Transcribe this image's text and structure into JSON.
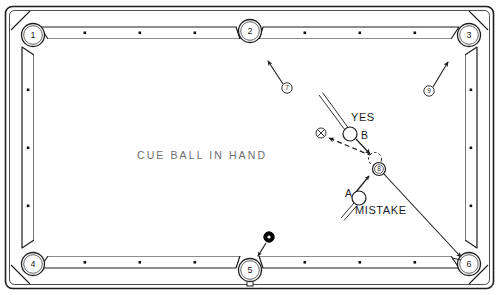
{
  "diagram": {
    "type": "pool-table-shot-diagram",
    "title_text": "CUE BALL IN HAND",
    "yes_label": "YES",
    "mistake_label": "MISTAKE",
    "ball_a_label": "A",
    "ball_b_label": "B",
    "eight_ball_label": "8",
    "x_mark_label": "X"
  },
  "pockets": [
    {
      "id": "p1",
      "label": "1",
      "position": "top-left",
      "cx": 33,
      "cy": 35
    },
    {
      "id": "p2",
      "label": "2",
      "position": "top-center",
      "cx": 250,
      "cy": 31
    },
    {
      "id": "p3",
      "label": "3",
      "position": "top-right",
      "cx": 469,
      "cy": 35
    },
    {
      "id": "p4",
      "label": "4",
      "position": "bottom-left",
      "cx": 33,
      "cy": 264
    },
    {
      "id": "p5",
      "label": "5",
      "position": "bottom-center",
      "cx": 250,
      "cy": 270
    },
    {
      "id": "p6",
      "label": "6",
      "position": "bottom-right",
      "cx": 469,
      "cy": 264
    }
  ],
  "object_balls": [
    {
      "id": "ball7",
      "label": "7",
      "cx": 287,
      "cy": 88,
      "arrow_to_x": 270,
      "arrow_to_y": 62
    },
    {
      "id": "ball9",
      "label": "9",
      "cx": 429,
      "cy": 91,
      "arrow_to_x": 447,
      "arrow_to_y": 62
    }
  ],
  "cue_balls": [
    {
      "id": "ball_b",
      "label": "B",
      "cx": 350,
      "cy": 134,
      "r": 7.0
    },
    {
      "id": "ball_a",
      "label": "A",
      "cx": 359,
      "cy": 198,
      "r": 7.0
    }
  ],
  "ghost_ball": {
    "id": "ghost",
    "cx": 375,
    "cy": 159,
    "r": 6.5
  },
  "eight_ball": {
    "id": "ball8",
    "cx": 379,
    "cy": 169,
    "r": 6.5
  },
  "x_mark": {
    "id": "xmark",
    "cx": 321,
    "cy": 133,
    "r": 5.0
  },
  "black_ball": {
    "id": "black_ball",
    "cx": 269,
    "cy": 237,
    "r": 5.0
  },
  "rail_diamonds": {
    "top": [
      85,
      140,
      195,
      305,
      360,
      415
    ],
    "bottom": [
      85,
      140,
      195,
      305,
      360,
      415
    ],
    "left": [
      90,
      148,
      206
    ],
    "right": [
      90,
      148,
      206
    ]
  },
  "colors": {
    "line": "#1d1d1d",
    "rail": "#ffffff",
    "cloth": "#ffffff",
    "text": "#1d1d1d",
    "muted_text": "#6e6e6e",
    "black_ball": "#000000"
  }
}
